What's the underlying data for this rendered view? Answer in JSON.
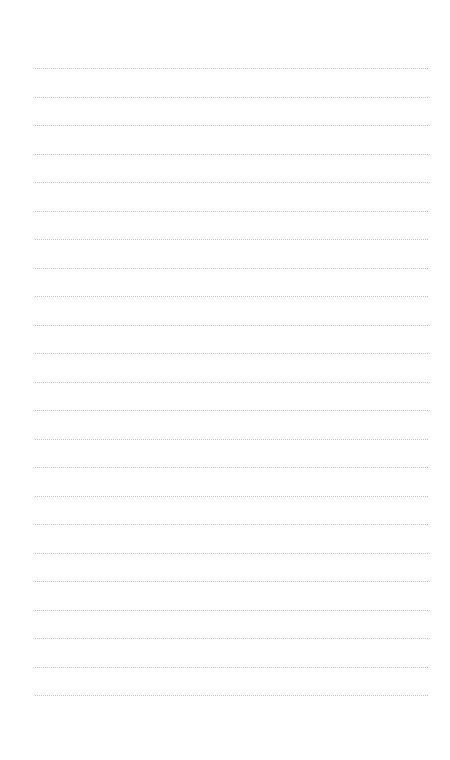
{
  "page": {
    "type": "lined-paper",
    "background_color": "#ffffff",
    "line_color": "#c9c9c9",
    "line_count": 23,
    "first_line_y": 68,
    "line_spacing": 28.5,
    "line_left": 35,
    "line_right": 428,
    "text": ""
  }
}
